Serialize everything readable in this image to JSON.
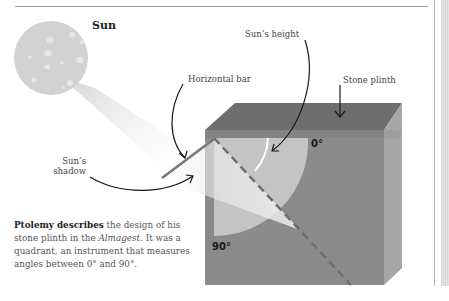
{
  "diagram": {
    "sun_label": "Sun",
    "labels": {
      "sun_height": "Sun’s height",
      "horizontal_bar": "Horizontal bar",
      "stone_plinth": "Stone plinth",
      "sun_shadow_line1": "Sun’s",
      "sun_shadow_line2": "shadow"
    },
    "angles": {
      "zero": "0°",
      "ninety": "90°"
    },
    "colors": {
      "sun": "#d2d2d2",
      "plinth_front": "#8c8c8c",
      "plinth_top": "#6e6e6e",
      "plinth_side": "#a6a6a6",
      "quadrant": "#c4c4c4"
    }
  },
  "caption": {
    "bold_lead": "Ptolemy describes",
    "text_1": " the design of his stone plinth in the ",
    "italic": "Almagest",
    "text_2": ". It was a quadrant, an instrument that measures angles between 0° and 90°."
  }
}
